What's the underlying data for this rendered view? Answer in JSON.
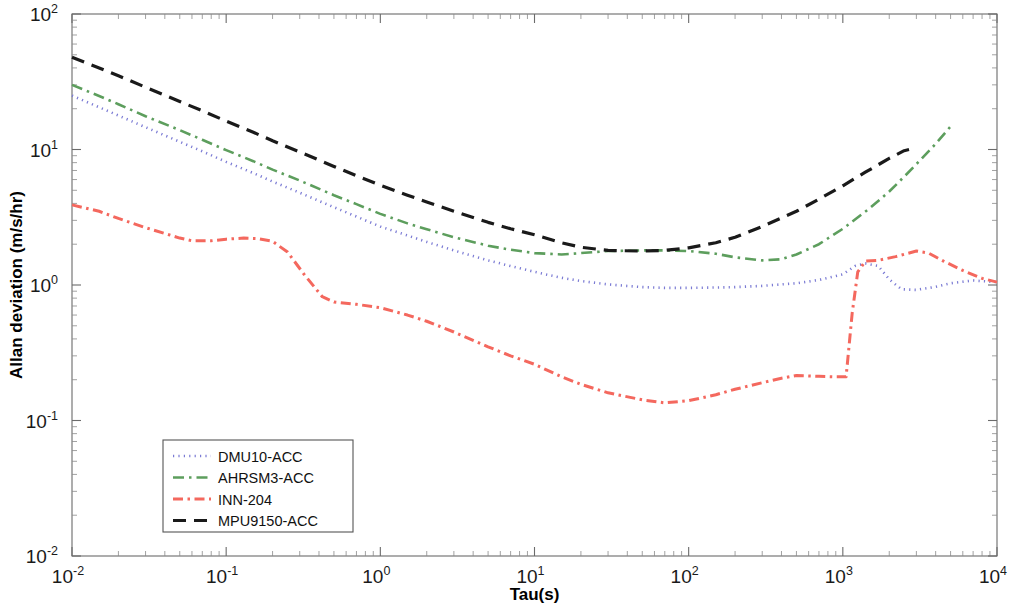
{
  "chart_data": {
    "type": "line",
    "title": "",
    "xlabel": "Tau(s)",
    "ylabel": "Allan deviation (m/s/hr)",
    "xscale": "log",
    "yscale": "log",
    "xlim": [
      0.01,
      10000
    ],
    "ylim": [
      0.01,
      100
    ],
    "grid": false,
    "legend_position": "lower-left",
    "xticks": [
      "10^-2",
      "10^-1",
      "10^0",
      "10^1",
      "10^2",
      "10^3",
      "10^4"
    ],
    "yticks": [
      "10^-2",
      "10^-1",
      "10^0",
      "10^1",
      "10^2"
    ],
    "xtick_labels": [
      {
        "mantissa": "10",
        "exponent": "-2"
      },
      {
        "mantissa": "10",
        "exponent": "-1"
      },
      {
        "mantissa": "10",
        "exponent": "0"
      },
      {
        "mantissa": "10",
        "exponent": "1"
      },
      {
        "mantissa": "10",
        "exponent": "2"
      },
      {
        "mantissa": "10",
        "exponent": "3"
      },
      {
        "mantissa": "10",
        "exponent": "4"
      }
    ],
    "ytick_labels": [
      {
        "mantissa": "10",
        "exponent": "2"
      },
      {
        "mantissa": "10",
        "exponent": "1"
      },
      {
        "mantissa": "10",
        "exponent": "0"
      },
      {
        "mantissa": "10",
        "exponent": "-1"
      },
      {
        "mantissa": "10",
        "exponent": "-2"
      }
    ],
    "series": [
      {
        "name": "DMU10-ACC",
        "color": "#7b7bd4",
        "linestyle": "dotted",
        "dasharray": "1.2 4.2",
        "width": 2.6,
        "points": [
          [
            0.01,
            25.0
          ],
          [
            0.015,
            20.5
          ],
          [
            0.02,
            17.8
          ],
          [
            0.03,
            14.6
          ],
          [
            0.05,
            11.4
          ],
          [
            0.07,
            9.7
          ],
          [
            0.1,
            8.1
          ],
          [
            0.15,
            6.7
          ],
          [
            0.2,
            5.8
          ],
          [
            0.3,
            4.8
          ],
          [
            0.5,
            3.75
          ],
          [
            0.7,
            3.2
          ],
          [
            1.0,
            2.7
          ],
          [
            1.5,
            2.32
          ],
          [
            2.0,
            2.08
          ],
          [
            3.0,
            1.8
          ],
          [
            5.0,
            1.52
          ],
          [
            7.0,
            1.38
          ],
          [
            10.0,
            1.25
          ],
          [
            15.0,
            1.13
          ],
          [
            20.0,
            1.07
          ],
          [
            30.0,
            1.01
          ],
          [
            50.0,
            0.965
          ],
          [
            70.0,
            0.952
          ],
          [
            100.0,
            0.952
          ],
          [
            150.0,
            0.958
          ],
          [
            200.0,
            0.965
          ],
          [
            300.0,
            0.985
          ],
          [
            500.0,
            1.03
          ],
          [
            700.0,
            1.09
          ],
          [
            1000.0,
            1.2
          ],
          [
            1200.0,
            1.38
          ],
          [
            1400.0,
            1.44
          ],
          [
            1700.0,
            1.38
          ],
          [
            2000.0,
            1.1
          ],
          [
            2400.0,
            0.93
          ],
          [
            3000.0,
            0.92
          ],
          [
            4000.0,
            0.97
          ],
          [
            5000.0,
            1.03
          ],
          [
            7000.0,
            1.08
          ],
          [
            10000.0,
            1.05
          ]
        ]
      },
      {
        "name": "AHRSM3-ACC",
        "color": "#5d9e5d",
        "linestyle": "dashdot",
        "dasharray": "11 5 2.5 5",
        "width": 2.6,
        "points": [
          [
            0.01,
            30.0
          ],
          [
            0.015,
            24.8
          ],
          [
            0.02,
            21.6
          ],
          [
            0.03,
            17.6
          ],
          [
            0.05,
            13.9
          ],
          [
            0.07,
            11.8
          ],
          [
            0.1,
            9.9
          ],
          [
            0.15,
            8.2
          ],
          [
            0.2,
            7.1
          ],
          [
            0.3,
            5.9
          ],
          [
            0.5,
            4.6
          ],
          [
            0.7,
            3.95
          ],
          [
            1.0,
            3.35
          ],
          [
            1.5,
            2.85
          ],
          [
            2.0,
            2.58
          ],
          [
            3.0,
            2.25
          ],
          [
            5.0,
            1.95
          ],
          [
            7.0,
            1.82
          ],
          [
            10.0,
            1.72
          ],
          [
            15.0,
            1.68
          ],
          [
            20.0,
            1.72
          ],
          [
            30.0,
            1.78
          ],
          [
            50.0,
            1.8
          ],
          [
            70.0,
            1.8
          ],
          [
            100.0,
            1.78
          ],
          [
            150.0,
            1.7
          ],
          [
            200.0,
            1.6
          ],
          [
            300.0,
            1.52
          ],
          [
            400.0,
            1.55
          ],
          [
            500.0,
            1.68
          ],
          [
            700.0,
            2.0
          ],
          [
            1000.0,
            2.6
          ],
          [
            1500.0,
            3.7
          ],
          [
            2000.0,
            4.9
          ],
          [
            2500.0,
            6.3
          ],
          [
            3000.0,
            7.8
          ],
          [
            4000.0,
            11.0
          ],
          [
            5000.0,
            14.8
          ]
        ]
      },
      {
        "name": "INN-204",
        "color": "#f4685e",
        "linestyle": "dashdot",
        "dasharray": "10 4.5 2.5 4.5",
        "width": 3.0,
        "points": [
          [
            0.01,
            3.9
          ],
          [
            0.015,
            3.5
          ],
          [
            0.02,
            3.1
          ],
          [
            0.03,
            2.65
          ],
          [
            0.04,
            2.4
          ],
          [
            0.05,
            2.22
          ],
          [
            0.06,
            2.12
          ],
          [
            0.08,
            2.12
          ],
          [
            0.1,
            2.18
          ],
          [
            0.13,
            2.22
          ],
          [
            0.16,
            2.2
          ],
          [
            0.2,
            2.1
          ],
          [
            0.25,
            1.75
          ],
          [
            0.32,
            1.2
          ],
          [
            0.42,
            0.82
          ],
          [
            0.5,
            0.75
          ],
          [
            0.7,
            0.72
          ],
          [
            1.0,
            0.68
          ],
          [
            1.5,
            0.6
          ],
          [
            2.0,
            0.54
          ],
          [
            3.0,
            0.45
          ],
          [
            5.0,
            0.35
          ],
          [
            7.0,
            0.3
          ],
          [
            10.0,
            0.26
          ],
          [
            15.0,
            0.21
          ],
          [
            20.0,
            0.185
          ],
          [
            30.0,
            0.16
          ],
          [
            50.0,
            0.142
          ],
          [
            70.0,
            0.135
          ],
          [
            100.0,
            0.14
          ],
          [
            150.0,
            0.155
          ],
          [
            200.0,
            0.17
          ],
          [
            300.0,
            0.19
          ],
          [
            400.0,
            0.205
          ],
          [
            500.0,
            0.215
          ],
          [
            700.0,
            0.212
          ],
          [
            900.0,
            0.21
          ],
          [
            1050.0,
            0.21
          ],
          [
            1150.0,
            0.62
          ],
          [
            1250.0,
            1.25
          ],
          [
            1400.0,
            1.5
          ],
          [
            1700.0,
            1.52
          ],
          [
            2200.0,
            1.62
          ],
          [
            3000.0,
            1.78
          ],
          [
            3600.0,
            1.72
          ],
          [
            4500.0,
            1.5
          ],
          [
            6000.0,
            1.28
          ],
          [
            8000.0,
            1.12
          ],
          [
            10000.0,
            1.05
          ]
        ]
      },
      {
        "name": "MPU9150-ACC",
        "color": "#1a1a1a",
        "linestyle": "dashed",
        "dasharray": "13 8",
        "width": 3.2,
        "points": [
          [
            0.01,
            48.0
          ],
          [
            0.015,
            40.0
          ],
          [
            0.02,
            35.0
          ],
          [
            0.03,
            28.8
          ],
          [
            0.05,
            22.6
          ],
          [
            0.07,
            19.3
          ],
          [
            0.1,
            16.2
          ],
          [
            0.15,
            13.4
          ],
          [
            0.2,
            11.6
          ],
          [
            0.3,
            9.6
          ],
          [
            0.5,
            7.5
          ],
          [
            0.7,
            6.4
          ],
          [
            1.0,
            5.45
          ],
          [
            1.5,
            4.6
          ],
          [
            2.0,
            4.1
          ],
          [
            3.0,
            3.5
          ],
          [
            5.0,
            2.9
          ],
          [
            7.0,
            2.6
          ],
          [
            10.0,
            2.35
          ],
          [
            15.0,
            2.05
          ],
          [
            20.0,
            1.9
          ],
          [
            30.0,
            1.8
          ],
          [
            50.0,
            1.78
          ],
          [
            70.0,
            1.8
          ],
          [
            100.0,
            1.88
          ],
          [
            150.0,
            2.05
          ],
          [
            200.0,
            2.25
          ],
          [
            300.0,
            2.7
          ],
          [
            500.0,
            3.5
          ],
          [
            700.0,
            4.3
          ],
          [
            1000.0,
            5.4
          ],
          [
            1400.0,
            6.8
          ],
          [
            2000.0,
            8.6
          ],
          [
            2500.0,
            9.8
          ],
          [
            2800.0,
            10.1
          ]
        ]
      }
    ]
  },
  "legend": {
    "items": [
      {
        "label": "DMU10-ACC"
      },
      {
        "label": "AHRSM3-ACC"
      },
      {
        "label": "INN-204"
      },
      {
        "label": "MPU9150-ACC"
      }
    ]
  },
  "axes": {
    "x_title": "Tau(s)",
    "y_title": "Allan deviation (m/s/hr)"
  }
}
